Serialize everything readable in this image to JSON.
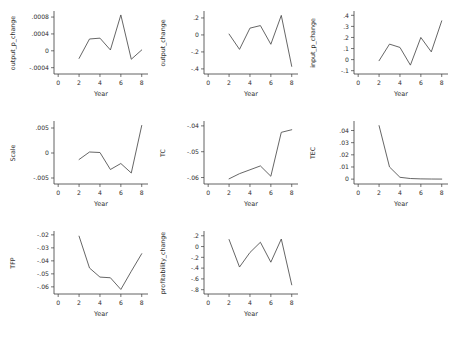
{
  "figure": {
    "width": 460,
    "height": 340,
    "background": "#ffffff",
    "line_color": "#4a4a4a",
    "axis_color": "#3a3a3a",
    "rows": 3,
    "cols": 3,
    "shared_xlabel": "Year"
  },
  "chart_data": [
    {
      "type": "line",
      "title": "",
      "xlabel": "Year",
      "ylabel": "output_p_change",
      "x": [
        2,
        3,
        4,
        5,
        6,
        7,
        8
      ],
      "values": [
        -0.00018,
        0.00028,
        0.0003,
        2e-05,
        0.00085,
        -0.0002,
        2e-05
      ],
      "xlim": [
        -0.4,
        8.6
      ],
      "ylim": [
        -0.00055,
        0.00092
      ],
      "xticks": [
        0,
        2,
        4,
        6,
        8
      ],
      "xticklabels": [
        "0",
        "2",
        "4",
        "6",
        "8"
      ],
      "yticks": [
        -0.0004,
        0,
        0.0004,
        0.0008
      ],
      "yticklabels": [
        "-.0004",
        "0",
        ".0004",
        ".0008"
      ],
      "grid": false,
      "legend": false
    },
    {
      "type": "line",
      "title": "",
      "xlabel": "Year",
      "ylabel": "output_change",
      "x": [
        2,
        3,
        4,
        5,
        6,
        7,
        8
      ],
      "values": [
        0.01,
        -0.17,
        0.08,
        0.11,
        -0.11,
        0.23,
        -0.37
      ],
      "xlim": [
        -0.4,
        8.6
      ],
      "ylim": [
        -0.46,
        0.27
      ],
      "xticks": [
        0,
        2,
        4,
        6,
        8
      ],
      "xticklabels": [
        "0",
        "2",
        "4",
        "6",
        "8"
      ],
      "yticks": [
        -0.4,
        -0.2,
        0,
        0.2
      ],
      "yticklabels": [
        "-.4",
        "-.2",
        "0",
        ".2"
      ],
      "grid": false,
      "legend": false
    },
    {
      "type": "line",
      "title": "",
      "xlabel": "Year",
      "ylabel": "input_p_change",
      "x": [
        2,
        3,
        4,
        5,
        6,
        7,
        8
      ],
      "values": [
        -0.01,
        0.14,
        0.11,
        -0.05,
        0.2,
        0.07,
        0.35
      ],
      "xlim": [
        -0.4,
        8.6
      ],
      "ylim": [
        -0.13,
        0.43
      ],
      "xticks": [
        0,
        2,
        4,
        6,
        8
      ],
      "xticklabels": [
        "0",
        "2",
        "4",
        "6",
        "8"
      ],
      "yticks": [
        -0.1,
        0,
        0.1,
        0.2,
        0.3,
        0.4
      ],
      "yticklabels": [
        "-.1",
        "0",
        ".1",
        ".2",
        ".3",
        ".4"
      ],
      "grid": false,
      "legend": false
    },
    {
      "type": "line",
      "title": "",
      "xlabel": "Year",
      "ylabel": "Scale",
      "x": [
        2,
        3,
        4,
        5,
        6,
        7,
        8
      ],
      "values": [
        -0.0013,
        0.0002,
        0.0001,
        -0.0033,
        -0.0021,
        -0.004,
        0.0055
      ],
      "xlim": [
        -0.4,
        8.6
      ],
      "ylim": [
        -0.0062,
        0.0062
      ],
      "xticks": [
        0,
        2,
        4,
        6,
        8
      ],
      "xticklabels": [
        "0",
        "2",
        "4",
        "6",
        "8"
      ],
      "yticks": [
        -0.005,
        0,
        0.005
      ],
      "yticklabels": [
        "-.005",
        "0",
        ".005"
      ],
      "grid": false,
      "legend": false
    },
    {
      "type": "line",
      "title": "",
      "xlabel": "Year",
      "ylabel": "TC",
      "x": [
        2,
        3,
        4,
        5,
        6,
        7,
        8
      ],
      "values": [
        -0.0605,
        -0.0585,
        -0.057,
        -0.0555,
        -0.0595,
        -0.0425,
        -0.0415
      ],
      "xlim": [
        -0.4,
        8.6
      ],
      "ylim": [
        -0.0625,
        -0.0385
      ],
      "xticks": [
        0,
        2,
        4,
        6,
        8
      ],
      "xticklabels": [
        "0",
        "2",
        "4",
        "6",
        "8"
      ],
      "yticks": [
        -0.06,
        -0.05,
        -0.04
      ],
      "yticklabels": [
        "-.06",
        "-.05",
        "-.04"
      ],
      "grid": false,
      "legend": false
    },
    {
      "type": "line",
      "title": "",
      "xlabel": "Year",
      "ylabel": "TEC",
      "x": [
        2,
        3,
        4,
        5,
        6,
        7,
        8
      ],
      "values": [
        0.044,
        0.01,
        0.0015,
        0.0005,
        0.0002,
        0.0001,
        5e-05
      ],
      "xlim": [
        -0.4,
        8.6
      ],
      "ylim": [
        -0.004,
        0.047
      ],
      "xticks": [
        0,
        2,
        4,
        6,
        8
      ],
      "xticklabels": [
        "0",
        "2",
        "4",
        "6",
        "8"
      ],
      "yticks": [
        0,
        0.01,
        0.02,
        0.03,
        0.04
      ],
      "yticklabels": [
        "0",
        ".01",
        ".02",
        ".03",
        ".04"
      ],
      "grid": false,
      "legend": false
    },
    {
      "type": "line",
      "title": "",
      "xlabel": "Year",
      "ylabel": "TFP",
      "x": [
        2,
        3,
        4,
        5,
        6,
        7,
        8
      ],
      "values": [
        -0.021,
        -0.0455,
        -0.0525,
        -0.053,
        -0.062,
        -0.048,
        -0.0345
      ],
      "xlim": [
        -0.4,
        8.6
      ],
      "ylim": [
        -0.0655,
        -0.0178
      ],
      "xticks": [
        0,
        2,
        4,
        6,
        8
      ],
      "xticklabels": [
        "0",
        "2",
        "4",
        "6",
        "8"
      ],
      "yticks": [
        -0.06,
        -0.05,
        -0.04,
        -0.03,
        -0.02
      ],
      "yticklabels": [
        "-.06",
        "-.05",
        "-.04",
        "-.03",
        "-.02"
      ],
      "grid": false,
      "legend": false
    },
    {
      "type": "line",
      "title": "",
      "xlabel": "Year",
      "ylabel": "profitability_change",
      "x": [
        2,
        3,
        4,
        5,
        6,
        7,
        8
      ],
      "values": [
        0.13,
        -0.38,
        -0.11,
        0.08,
        -0.29,
        0.14,
        -0.71
      ],
      "xlim": [
        -0.4,
        8.6
      ],
      "ylim": [
        -0.88,
        0.27
      ],
      "xticks": [
        0,
        2,
        4,
        6,
        8
      ],
      "xticklabels": [
        "0",
        "2",
        "4",
        "6",
        "8"
      ],
      "yticks": [
        -0.8,
        -0.6,
        -0.4,
        -0.2,
        0,
        0.2
      ],
      "yticklabels": [
        "-.8",
        "-.6",
        "-.4",
        "-.2",
        "0",
        ".2"
      ],
      "grid": false,
      "legend": false
    }
  ]
}
